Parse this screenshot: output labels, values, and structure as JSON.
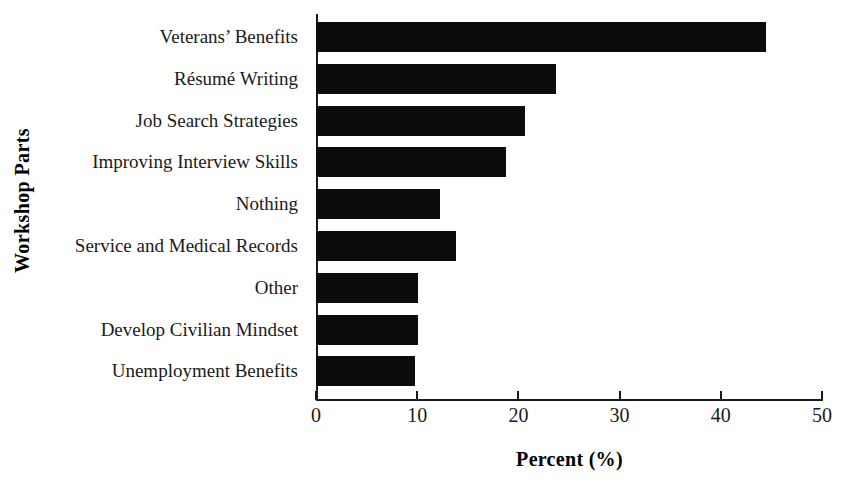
{
  "chart_data": {
    "type": "bar",
    "orientation": "horizontal",
    "title": "",
    "xlabel": "Percent (%)",
    "ylabel": "Workshop Parts",
    "xlim": [
      0,
      50
    ],
    "xticks": [
      0,
      10,
      20,
      30,
      40,
      50
    ],
    "xtick_labels": [
      "0",
      "10",
      "20",
      "30",
      "40",
      "50"
    ],
    "grid": false,
    "legend": null,
    "bar_color": "#0c0c0c",
    "axis_color": "#1a1a1a",
    "background_color": "#ffffff",
    "categories": [
      "Veterans’ Benefits",
      "Résumé Writing",
      "Job Search Strategies",
      "Improving Interview Skills",
      "Nothing",
      "Service and Medical Records",
      "Other",
      "Develop Civilian Mindset",
      "Unemployment Benefits"
    ],
    "values": [
      44.5,
      23.7,
      20.7,
      18.8,
      12.3,
      13.8,
      10.1,
      10.1,
      9.8
    ]
  }
}
